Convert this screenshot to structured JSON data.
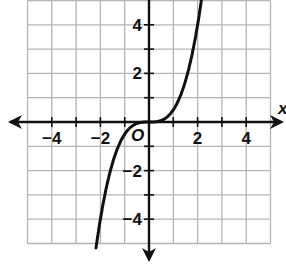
{
  "chart_data": {
    "type": "line",
    "title": "",
    "xlabel": "x",
    "ylabel": "y",
    "origin_label": "O",
    "xlim": [
      -5,
      5
    ],
    "ylim": [
      -5,
      5
    ],
    "grid": true,
    "x_ticks": [
      -4,
      -2,
      2,
      4
    ],
    "y_ticks": [
      4,
      2,
      -2,
      -4
    ],
    "x_tick_labels": [
      "−4",
      "−2",
      "2",
      "4"
    ],
    "y_tick_labels": [
      "4",
      "2",
      "−2",
      "−4"
    ],
    "series": [
      {
        "name": "f(x)",
        "function": "y = x^3 / 2",
        "x": [
          -2.15,
          -2,
          -1.5,
          -1,
          -0.5,
          0,
          0.5,
          1,
          1.5,
          2,
          2.15
        ],
        "y": [
          -4.97,
          -4.0,
          -1.69,
          -0.5,
          -0.06,
          0,
          0.06,
          0.5,
          1.69,
          4.0,
          4.97
        ]
      }
    ],
    "colors": {
      "curve": "#111111",
      "grid": "#b5b5b5",
      "axis": "#111111"
    }
  }
}
